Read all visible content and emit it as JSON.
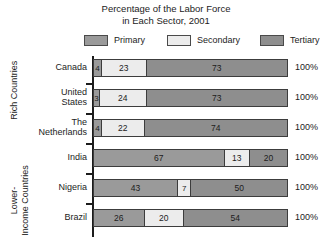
{
  "title": {
    "line1": "Percentage of the Labor Force",
    "line2": "in Each Sector, 2001"
  },
  "legend": {
    "items": [
      {
        "label": "Primary",
        "color": "#9a9a9a"
      },
      {
        "label": "Secondary",
        "color": "#ececec"
      },
      {
        "label": "Tertiary",
        "color": "#8e8e8e"
      }
    ]
  },
  "groups": [
    {
      "id": "rich",
      "line1": "Rich Countries",
      "line2": ""
    },
    {
      "id": "lower",
      "line1": "Lower-",
      "line2": "Income Countries"
    }
  ],
  "rows": [
    {
      "name_line1": "Canada",
      "name_line2": "",
      "values": [
        4,
        23,
        73
      ],
      "total": "100%"
    },
    {
      "name_line1": "United",
      "name_line2": "States",
      "values": [
        3,
        24,
        73
      ],
      "total": "100%"
    },
    {
      "name_line1": "The",
      "name_line2": "Netherlands",
      "values": [
        4,
        22,
        74
      ],
      "total": "100%"
    },
    {
      "name_line1": "India",
      "name_line2": "",
      "values": [
        67,
        13,
        20
      ],
      "total": "100%"
    },
    {
      "name_line1": "Nigeria",
      "name_line2": "",
      "values": [
        43,
        7,
        50
      ],
      "total": "100%"
    },
    {
      "name_line1": "Brazil",
      "name_line2": "",
      "values": [
        26,
        20,
        54
      ],
      "total": "100%"
    }
  ],
  "chart_data": {
    "type": "bar",
    "subtype": "horizontal-stacked-100",
    "title": "Percentage of the Labor Force in Each Sector, 2001",
    "xlabel": "",
    "ylabel": "",
    "xlim": [
      0,
      100
    ],
    "grid": false,
    "legend_position": "top",
    "categories": [
      "Canada",
      "United States",
      "The Netherlands",
      "India",
      "Nigeria",
      "Brazil"
    ],
    "category_groups": [
      {
        "label": "Rich Countries",
        "categories": [
          "Canada",
          "United States",
          "The Netherlands"
        ]
      },
      {
        "label": "Lower-Income Countries",
        "categories": [
          "India",
          "Nigeria",
          "Brazil"
        ]
      }
    ],
    "series": [
      {
        "name": "Primary",
        "color": "#9a9a9a",
        "values": [
          4,
          3,
          4,
          67,
          43,
          26
        ]
      },
      {
        "name": "Secondary",
        "color": "#ececec",
        "values": [
          23,
          24,
          22,
          13,
          7,
          20
        ]
      },
      {
        "name": "Tertiary",
        "color": "#8e8e8e",
        "values": [
          73,
          73,
          74,
          20,
          50,
          54
        ]
      }
    ],
    "row_totals": [
      "100%",
      "100%",
      "100%",
      "100%",
      "100%",
      "100%"
    ],
    "annotations": [
      "Data labels printed inside each segment",
      "Row totals printed at right edge"
    ]
  }
}
